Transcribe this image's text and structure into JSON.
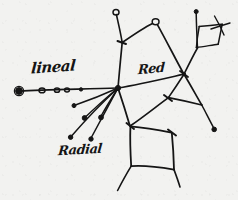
{
  "canvas": {
    "width": 238,
    "height": 200,
    "background_color": "#f2f2f0",
    "ink_color": "#151515",
    "medium": "hand-drawn pen sketch on paper"
  },
  "annotations": {
    "lineal": "lineal",
    "red": "Red",
    "radial": "Radial"
  },
  "diagram": {
    "node_count": 22,
    "regions": [
      {
        "name": "lineal-chain",
        "label": "lineal",
        "description": "horizontal chain of small circular nodes running left to the central hub"
      },
      {
        "name": "radial-hub",
        "label": "Radial",
        "description": "central junction with five short spokes ending in filled dots"
      },
      {
        "name": "network-mesh",
        "label": "Red",
        "description": "polygonal mesh of connected cells occupying the right and lower portion"
      }
    ]
  },
  "strokes": {
    "lineal_axis": "M 19,91 L 118,88",
    "hub_to_upper_left": "M 118,88 L 122,42 L 116,13",
    "hub_to_peak": "M 122,42 L 155,22",
    "peak_to_right_hub": "M 155,22 L 184,74",
    "hub_to_right_hub": "M 118,88 L 184,74",
    "right_hub_to_upper_stub": "M 184,74 L 198,47 L 196,12",
    "upper_stub_cross": "M 198,47 L 222,22",
    "quad_tr_a": "M 199,26 L 196,48",
    "quad_tr_b": "M 196,48 L 218,44",
    "quad_tr_c": "M 218,44 L 222,24",
    "quad_tr_d": "M 222,24 L 199,26",
    "right_hub_to_lower_right": "M 184,74 L 202,105",
    "lower_right_tail": "M 202,105 L 214,128",
    "right_hub_to_mid": "M 184,74 L 168,98",
    "mid_to_lower_left_cell": "M 168,98 L 130,126",
    "mid_to_lower_right": "M 168,98 L 202,105",
    "hub_to_lower_cell": "M 118,88 L 130,126",
    "cell_top": "M 130,126 L 172,132",
    "cell_right": "M 172,132 L 174,170",
    "cell_bottom": "M 174,170 L 131,166",
    "cell_left": "M 131,166 L 130,126",
    "cell_tail_left": "M 131,166 L 118,190",
    "cell_tail_right": "M 174,170 L 180,186",
    "spoke_1": "M 118,88 L 71,137",
    "spoke_2": "M 118,88 L 91,139",
    "spoke_3": "M 118,88 L 85,118",
    "spoke_4": "M 118,88 L 101,117",
    "spoke_5": "M 118,88 L 74,106"
  },
  "nodes": [
    {
      "name": "lineal-terminal",
      "x": 19,
      "y": 91,
      "type": "filled-ring"
    },
    {
      "name": "lineal-node-1",
      "x": 42,
      "y": 90,
      "type": "open"
    },
    {
      "name": "lineal-node-2",
      "x": 57,
      "y": 90,
      "type": "open"
    },
    {
      "name": "lineal-node-3",
      "x": 67,
      "y": 90,
      "type": "open"
    },
    {
      "name": "lineal-node-4",
      "x": 81,
      "y": 89,
      "type": "dot"
    },
    {
      "name": "central-hub",
      "x": 118,
      "y": 88,
      "type": "junction"
    },
    {
      "name": "upper-left-bend",
      "x": 122,
      "y": 42,
      "type": "junction"
    },
    {
      "name": "upper-left-terminal",
      "x": 116,
      "y": 13,
      "type": "open"
    },
    {
      "name": "peak-node",
      "x": 155,
      "y": 22,
      "type": "open"
    },
    {
      "name": "right-hub",
      "x": 184,
      "y": 74,
      "type": "junction"
    },
    {
      "name": "upper-stub-junction",
      "x": 198,
      "y": 47,
      "type": "junction"
    },
    {
      "name": "upper-stub-terminal",
      "x": 196,
      "y": 12,
      "type": "dot"
    },
    {
      "name": "quad-corner-tr",
      "x": 222,
      "y": 24,
      "type": "plain"
    },
    {
      "name": "quad-corner-br",
      "x": 218,
      "y": 44,
      "type": "plain"
    },
    {
      "name": "mid-junction",
      "x": 168,
      "y": 98,
      "type": "junction"
    },
    {
      "name": "lower-right-junction",
      "x": 202,
      "y": 105,
      "type": "junction"
    },
    {
      "name": "lower-right-terminal",
      "x": 214,
      "y": 128,
      "type": "dot"
    },
    {
      "name": "cell-corner-tl",
      "x": 130,
      "y": 126,
      "type": "junction"
    },
    {
      "name": "cell-corner-tr",
      "x": 172,
      "y": 132,
      "type": "junction"
    },
    {
      "name": "cell-corner-br",
      "x": 174,
      "y": 170,
      "type": "plain"
    },
    {
      "name": "cell-corner-bl",
      "x": 131,
      "y": 166,
      "type": "plain"
    },
    {
      "name": "spoke-terminal-1",
      "x": 71,
      "y": 137,
      "type": "dot"
    },
    {
      "name": "spoke-terminal-2",
      "x": 91,
      "y": 139,
      "type": "dot"
    },
    {
      "name": "spoke-terminal-3",
      "x": 85,
      "y": 118,
      "type": "dot"
    },
    {
      "name": "spoke-terminal-4",
      "x": 101,
      "y": 117,
      "type": "dot"
    },
    {
      "name": "spoke-terminal-5",
      "x": 74,
      "y": 106,
      "type": "dot"
    }
  ]
}
